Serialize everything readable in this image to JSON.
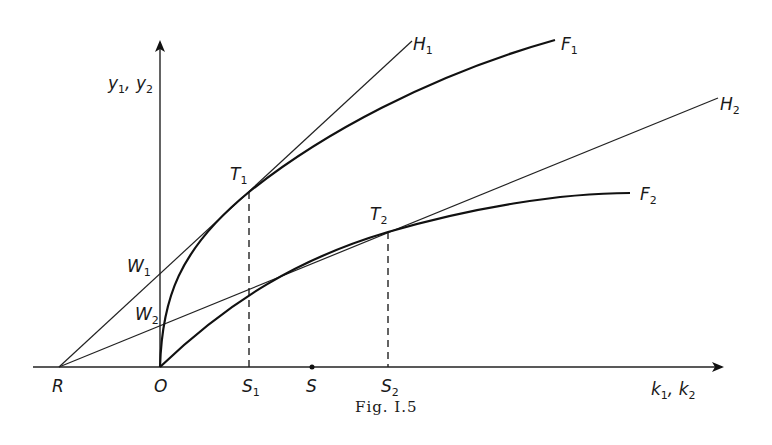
{
  "figure": {
    "caption": "Fig. I.5",
    "y_axis_label": {
      "main": "y",
      "s1": "1",
      "sep": ", ",
      "main2": "y",
      "s2": "2"
    },
    "x_axis_label": {
      "main": "k",
      "s1": "1",
      "sep": ", ",
      "main2": "k",
      "s2": "2"
    },
    "points": {
      "R": {
        "label": "R",
        "x": 59,
        "y": 367
      },
      "O": {
        "label": "O",
        "x": 160,
        "y": 367
      },
      "S1": {
        "label": "S",
        "sub": "1",
        "x": 249,
        "y": 367
      },
      "S": {
        "label": "S",
        "x": 312,
        "y": 367
      },
      "S2": {
        "label": "S",
        "sub": "2",
        "x": 388,
        "y": 367
      },
      "T1": {
        "label": "T",
        "sub": "1",
        "x": 249,
        "y": 192
      },
      "T2": {
        "label": "T",
        "sub": "2",
        "x": 388,
        "y": 232
      },
      "W1": {
        "label": "W",
        "sub": "1",
        "x": 160,
        "y": 273
      },
      "W2": {
        "label": "W",
        "sub": "2",
        "x": 160,
        "y": 324
      }
    },
    "curves": {
      "F1": {
        "label": "F",
        "sub": "1",
        "end": [
          555,
          40
        ]
      },
      "F2": {
        "label": "F",
        "sub": "2",
        "end": [
          630,
          193
        ]
      }
    },
    "lines": {
      "H1": {
        "label": "H",
        "sub": "1",
        "from": "R",
        "end": [
          412,
          41
        ]
      },
      "H2": {
        "label": "H",
        "sub": "2",
        "from": "R",
        "end": [
          718,
          98
        ]
      }
    }
  }
}
